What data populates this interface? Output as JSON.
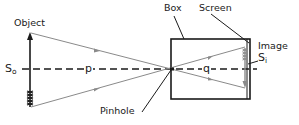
{
  "diagram": {
    "labels": {
      "object": "Object",
      "box": "Box",
      "screen": "Screen",
      "image": "Image",
      "pinhole": "Pinhole",
      "object_size_main": "S",
      "object_size_sub": "o",
      "image_size_main": "S",
      "image_size_sub": "i",
      "object_distance": "p",
      "image_distance": "q"
    },
    "colors": {
      "line": "#1a1a1a",
      "ray": "#8a8a8a",
      "background": "#ffffff"
    }
  }
}
